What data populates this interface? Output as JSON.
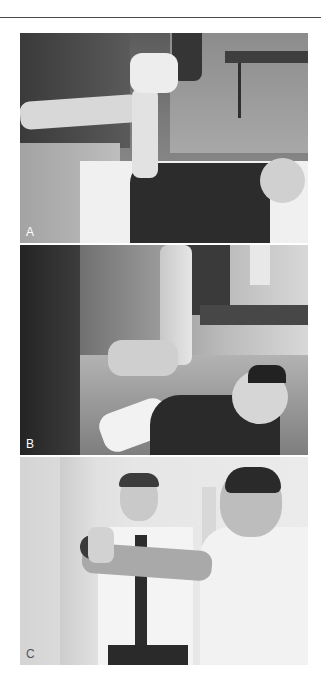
{
  "document": {
    "figure": {
      "panels": [
        {
          "label": "A",
          "description": "Therapist stabilizing supine patient's raised arm at the wrist"
        },
        {
          "label": "B",
          "description": "Therapist applying pressure to supine patient's vertically raised arm"
        },
        {
          "label": "C",
          "description": "Standing patient pressing a ball against a wall with outstretched arm while therapist observes"
        }
      ]
    }
  }
}
